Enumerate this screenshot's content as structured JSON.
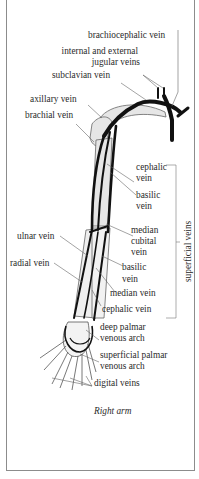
{
  "diagram": {
    "caption": "Right arm",
    "labels": {
      "brachiocephalic": "brachiocephalic vein",
      "jugular_1": "internal and external",
      "jugular_2": "jugular veins",
      "subclavian": "subclavian vein",
      "axillary": "axillary vein",
      "brachial": "brachial vein",
      "cephalic_upper_1": "cephalic",
      "cephalic_upper_2": "vein",
      "basilic_upper_1": "basilic",
      "basilic_upper_2": "vein",
      "median_cubital_1": "median",
      "median_cubital_2": "cubital",
      "median_cubital_3": "vein",
      "ulnar": "ulnar vein",
      "radial": "radial vein",
      "basilic_lower_1": "basilic",
      "basilic_lower_2": "vein",
      "median": "median vein",
      "cephalic_lower": "cephalic vein",
      "deep_palmar_1": "deep palmar",
      "deep_palmar_2": "venous arch",
      "superficial_palmar_1": "superficial palmar",
      "superficial_palmar_2": "venous arch",
      "digital": "digital veins"
    },
    "group_bracket": "superficial veins",
    "colors": {
      "vein": "#111111",
      "bone_fill": "#e4e4e4",
      "outline": "#555555",
      "leader": "#666666",
      "border": "#8c8c8c"
    }
  }
}
